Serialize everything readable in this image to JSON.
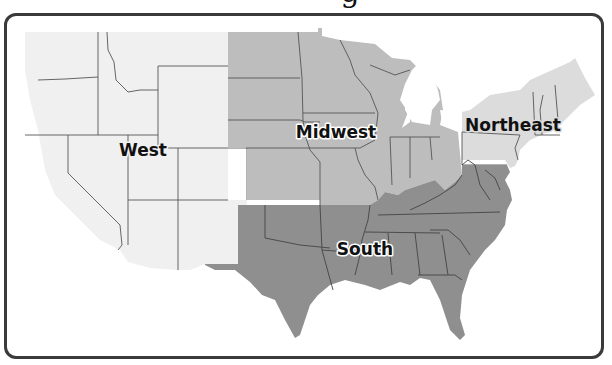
{
  "title": {
    "visible_fragment": "g",
    "note_hidden": ""
  },
  "map": {
    "subject": "United States census regions",
    "regions": [
      {
        "name": "West",
        "fill": "#f0f0f0",
        "label_x": 143,
        "label_y": 156
      },
      {
        "name": "Midwest",
        "fill": "#bdbdbd",
        "label_x": 336,
        "label_y": 138
      },
      {
        "name": "Northeast",
        "fill": "#dcdcdc",
        "label_x": 513,
        "label_y": 131
      },
      {
        "name": "South",
        "fill": "#8f8f8f",
        "label_x": 365,
        "label_y": 255
      }
    ],
    "border_color": "#3a3a3a",
    "state_line_color": "#555555"
  }
}
